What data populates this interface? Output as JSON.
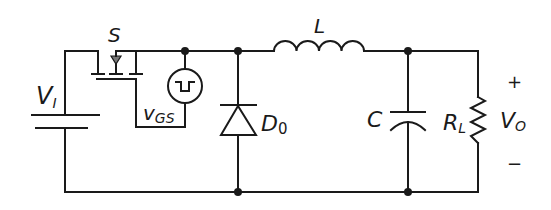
{
  "diagram": {
    "labels": {
      "source_voltage": "V",
      "source_voltage_sub": "I",
      "switch": "S",
      "gate_voltage": "v",
      "gate_voltage_sub": "GS",
      "diode": "D",
      "diode_sub": "0",
      "inductor": "L",
      "capacitor": "C",
      "load": "R",
      "load_sub": "L",
      "output_voltage": "V",
      "output_voltage_sub": "O",
      "plus": "+",
      "minus": "−"
    },
    "components": [
      {
        "id": "VI",
        "type": "dc-source"
      },
      {
        "id": "S",
        "type": "mosfet-switch"
      },
      {
        "id": "vGS",
        "type": "pulse-source"
      },
      {
        "id": "D0",
        "type": "diode"
      },
      {
        "id": "L",
        "type": "inductor"
      },
      {
        "id": "C",
        "type": "capacitor"
      },
      {
        "id": "RL",
        "type": "resistor"
      }
    ],
    "colors": {
      "line": "#1a1a1a",
      "background": "#ffffff"
    }
  }
}
